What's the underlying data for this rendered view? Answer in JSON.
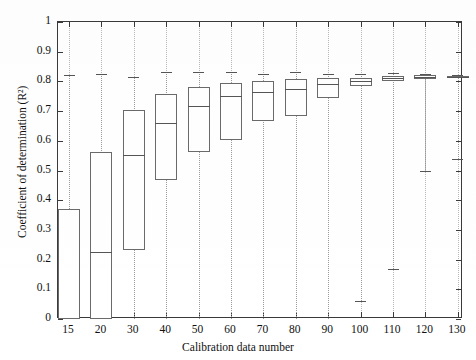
{
  "chart_data": {
    "type": "box",
    "title": "",
    "xlabel": "Calibration data number",
    "ylabel": "Coefficient of determination (R²)",
    "ylim": [
      0,
      1
    ],
    "yticks": [
      0,
      0.1,
      0.2,
      0.3,
      0.4,
      0.5,
      0.6,
      0.7,
      0.8,
      0.9,
      1
    ],
    "ytick_labels": [
      "0",
      "0.1",
      "0.2",
      "0.3",
      "0.4",
      "0.5",
      "0.6",
      "0.7",
      "0.8",
      "0.9",
      "1"
    ],
    "categories": [
      "15",
      "20",
      "30",
      "40",
      "50",
      "60",
      "70",
      "80",
      "90",
      "100",
      "110",
      "120",
      "130"
    ],
    "xtick_labels": [
      "15",
      "20",
      "30",
      "40",
      "50",
      "60",
      "70",
      "80",
      "90",
      "100",
      "110",
      "120",
      "130"
    ],
    "grid": "vertical-dotted",
    "legend": "none",
    "boxes": [
      {
        "category": "15",
        "whisker_low": 0.0,
        "q1": 0.0,
        "median": null,
        "q3": 0.37,
        "whisker_high": 0.82
      },
      {
        "category": "20",
        "whisker_low": 0.0,
        "q1": 0.0,
        "median": 0.226,
        "q3": 0.562,
        "whisker_high": 0.825
      },
      {
        "category": "30",
        "whisker_low": 0.0,
        "q1": 0.232,
        "median": 0.553,
        "q3": 0.703,
        "whisker_high": 0.815
      },
      {
        "category": "40",
        "whisker_low": 0.0,
        "q1": 0.468,
        "median": 0.66,
        "q3": 0.757,
        "whisker_high": 0.833
      },
      {
        "category": "50",
        "whisker_low": 0.0,
        "q1": 0.562,
        "median": 0.718,
        "q3": 0.782,
        "whisker_high": 0.833
      },
      {
        "category": "60",
        "whisker_low": 0.0,
        "q1": 0.604,
        "median": 0.75,
        "q3": 0.795,
        "whisker_high": 0.83
      },
      {
        "category": "70",
        "whisker_low": 0.0,
        "q1": 0.668,
        "median": 0.765,
        "q3": 0.8,
        "whisker_high": 0.826
      },
      {
        "category": "80",
        "whisker_low": 0.0,
        "q1": 0.685,
        "median": 0.773,
        "q3": 0.808,
        "whisker_high": 0.83
      },
      {
        "category": "90",
        "whisker_low": 0.0,
        "q1": 0.744,
        "median": 0.79,
        "q3": 0.812,
        "whisker_high": 0.826
      },
      {
        "category": "100",
        "whisker_low": 0.06,
        "q1": 0.783,
        "median": 0.8,
        "q3": 0.812,
        "whisker_high": 0.824
      },
      {
        "category": "110",
        "whisker_low": 0.17,
        "q1": 0.803,
        "median": 0.811,
        "q3": 0.818,
        "whisker_high": 0.827
      },
      {
        "category": "120",
        "whisker_low": 0.5,
        "q1": 0.808,
        "median": 0.814,
        "q3": 0.82,
        "whisker_high": 0.826
      },
      {
        "category": "130",
        "whisker_low": 0.54,
        "q1": 0.812,
        "median": 0.815,
        "q3": 0.818,
        "whisker_high": 0.822
      }
    ]
  },
  "style": {
    "axis_color": "#3a3a3a",
    "box_color": "#6a6a6a",
    "whisker_color": "#9a9a9a",
    "median_color": "#555555",
    "background": "#ffffff"
  }
}
